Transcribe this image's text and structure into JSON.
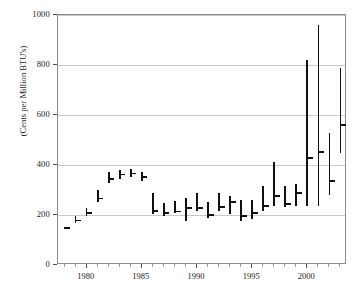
{
  "chart_data": {
    "type": "bar",
    "subtype": "high-low-close range bars",
    "title": "",
    "xlabel": "",
    "ylabel": "(Cents per Million BTU's)",
    "xlim": [
      1977.4,
      2003.6
    ],
    "ylim": [
      0,
      1000
    ],
    "ytick_values": [
      0,
      200,
      400,
      600,
      800,
      1000
    ],
    "ytick_labels": [
      "0",
      "200",
      "400",
      "600",
      "800",
      "1000"
    ],
    "xtick_values": [
      1980,
      1985,
      1990,
      1995,
      2000
    ],
    "xtick_labels": [
      "1980",
      "1985",
      "1990",
      "1995",
      "2000"
    ],
    "x_minor_tick_interval": 1,
    "grid": "horizontal",
    "legend": "none",
    "annotations": [],
    "x": [
      1978,
      1979,
      1980,
      1981,
      1982,
      1983,
      1984,
      1985,
      1986,
      1987,
      1988,
      1989,
      1990,
      1991,
      1992,
      1993,
      1994,
      1995,
      1996,
      1997,
      1998,
      1999,
      2000,
      2001,
      2002,
      2003
    ],
    "series": [
      {
        "name": "high",
        "values": [
          152,
          196,
          228,
          300,
          372,
          380,
          386,
          374,
          290,
          248,
          256,
          268,
          290,
          252,
          288,
          276,
          260,
          260,
          316,
          412,
          316,
          324,
          820,
          960,
          528,
          790
        ]
      },
      {
        "name": "low",
        "values": [
          144,
          168,
          196,
          252,
          330,
          346,
          352,
          338,
          206,
          198,
          208,
          178,
          216,
          190,
          218,
          206,
          176,
          184,
          218,
          238,
          232,
          236,
          236,
          236,
          280,
          450
        ]
      },
      {
        "name": "close",
        "values": [
          148,
          178,
          208,
          266,
          344,
          362,
          366,
          352,
          216,
          208,
          214,
          228,
          228,
          200,
          232,
          252,
          196,
          208,
          236,
          276,
          244,
          288,
          428,
          452,
          336,
          560
        ]
      }
    ]
  }
}
